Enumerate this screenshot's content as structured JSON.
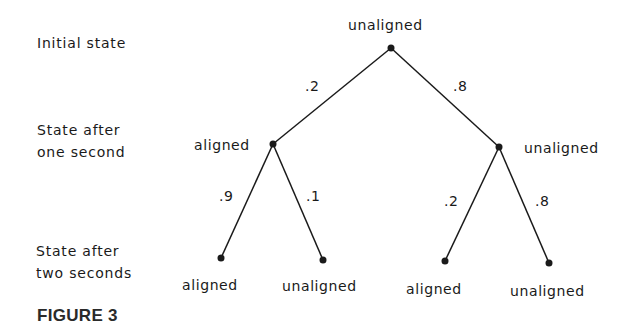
{
  "row_labels": {
    "initial": "Initial state",
    "one_second_line1": "State after",
    "one_second_line2": "one second",
    "two_seconds_line1": "State after",
    "two_seconds_line2": "two seconds"
  },
  "nodes": {
    "root": "unaligned",
    "l1_left": "aligned",
    "l1_right": "unaligned",
    "l2_ll": "aligned",
    "l2_lr": "unaligned",
    "l2_rl": "aligned",
    "l2_rr": "unaligned"
  },
  "probabilities": {
    "root_to_left": ".2",
    "root_to_right": ".8",
    "left_to_ll": ".9",
    "left_to_lr": ".1",
    "right_to_rl": ".2",
    "right_to_rr": ".8"
  },
  "caption": "FIGURE 3",
  "colors": {
    "ink": "#1a1a1a",
    "background": "#ffffff"
  }
}
